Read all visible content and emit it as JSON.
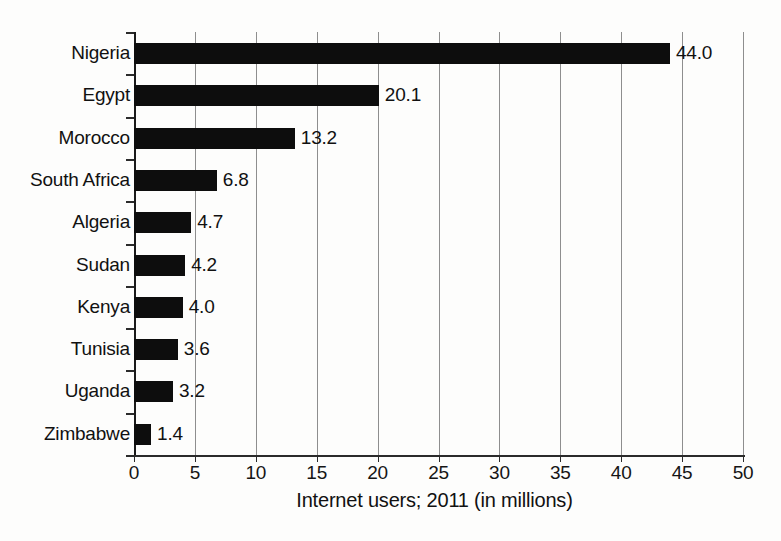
{
  "chart_data": {
    "type": "bar",
    "orientation": "horizontal",
    "title": "",
    "subtitle": "",
    "xlabel": "Internet users; 2011 (in millions)",
    "ylabel": "",
    "categories": [
      "Nigeria",
      "Egypt",
      "Morocco",
      "South Africa",
      "Algeria",
      "Sudan",
      "Kenya",
      "Tunisia",
      "Uganda",
      "Zimbabwe"
    ],
    "values": [
      44.0,
      20.1,
      13.2,
      6.8,
      4.7,
      4.2,
      4.0,
      3.6,
      3.2,
      1.4
    ],
    "value_labels": [
      "44.0",
      "20.1",
      "13.2",
      "6.8",
      "4.7",
      "4.2",
      "4.0",
      "3.6",
      "3.2",
      "1.4"
    ],
    "xlim": [
      0,
      50
    ],
    "xticks": [
      0,
      5,
      10,
      15,
      20,
      25,
      30,
      35,
      40,
      45,
      50
    ],
    "xtick_labels": [
      "0",
      "5",
      "10",
      "15",
      "20",
      "25",
      "30",
      "35",
      "40",
      "45",
      "50"
    ],
    "grid": true,
    "grid_axis": "x",
    "legend": false,
    "legend_position": "none",
    "bar_color": "#0d0d0d",
    "grid_color": "#8e8e8e",
    "axis_color": "#2b2b2b",
    "background_color": "#fdfdfc"
  }
}
